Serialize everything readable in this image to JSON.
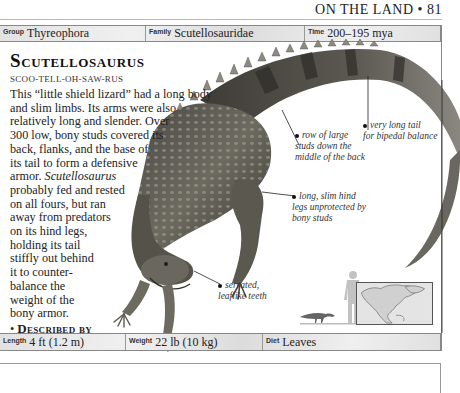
{
  "running_head": {
    "section": "ON THE LAND",
    "separator": "•",
    "page_number": "81"
  },
  "top_bar": {
    "group": {
      "label": "Group",
      "value": "Thyreophora"
    },
    "family": {
      "label": "Family",
      "value": "Scutellosauridae"
    },
    "time": {
      "label": "Time",
      "value": "200–195 mya"
    }
  },
  "entry": {
    "title": "Scutellosaurus",
    "pronunciation": "SCOO-TELL-OH-SAW-RUS",
    "body_lines": [
      "This “little shield lizard” had a long body",
      "and slim limbs. Its arms were also",
      "relatively long and slender. Over",
      "300 low, bony studs covered its",
      "back, flanks, and the base of",
      "its tail to form a defensive",
      "armor.",
      "probably fed and rested",
      "on all fours, but ran",
      "away from predators",
      "on its hind legs,",
      "holding its tail",
      "stiffly out behind",
      "it to counter-",
      "balance the",
      "weight of the",
      "bony armor."
    ],
    "italic_name": "Scutellosaurus",
    "described_by": {
      "label": "Described by",
      "value_line1": "Edwin H. Colbert;",
      "value_line2": "1981."
    },
    "habitat": {
      "label": "Habitat",
      "value": "Woodland."
    }
  },
  "annotations": {
    "tail": [
      "very long tail",
      "for bipedal balance"
    ],
    "studs": [
      "row of large",
      "studs down the",
      "middle of the back"
    ],
    "legs": [
      "long, slim hind",
      "legs unprotected by",
      "bony studs"
    ],
    "teeth": [
      "serrated,",
      "leaflike teeth"
    ]
  },
  "bottom_bar": {
    "length": {
      "label": "Length",
      "value": "4 ft (1.2 m)"
    },
    "weight": {
      "label": "Weight",
      "value": "22 lb (10 kg)"
    },
    "diet": {
      "label": "Diet",
      "value": "Leaves"
    }
  },
  "figures": {
    "illustration": "scutellosaurus-illustration",
    "scale": "human-vs-dinosaur-scale-silhouette",
    "map": "north-america-map"
  }
}
